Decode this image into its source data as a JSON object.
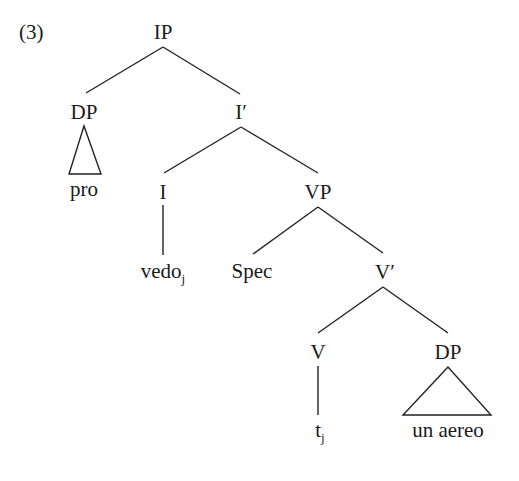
{
  "example_number": "(3)",
  "tree": {
    "root": "IP",
    "nodes": {
      "ip": {
        "label": "IP"
      },
      "dp_subject": {
        "label": "DP",
        "terminal": "pro",
        "triangle": true
      },
      "i_bar": {
        "label": "I",
        "prime": "′"
      },
      "i_head": {
        "label": "I",
        "terminal": "vedo",
        "terminal_subscript": "j"
      },
      "vp": {
        "label": "VP"
      },
      "spec": {
        "label": "Spec"
      },
      "v_bar": {
        "label": "V",
        "prime": "′"
      },
      "v_head": {
        "label": "V",
        "terminal": "t",
        "terminal_subscript": "j"
      },
      "dp_object": {
        "label": "DP",
        "terminal": "un aereo",
        "triangle": true
      }
    },
    "edges": [
      [
        "IP",
        "DP"
      ],
      [
        "IP",
        "I′"
      ],
      [
        "I′",
        "I"
      ],
      [
        "I′",
        "VP"
      ],
      [
        "I",
        "vedoj"
      ],
      [
        "VP",
        "Spec"
      ],
      [
        "VP",
        "V′"
      ],
      [
        "V′",
        "V"
      ],
      [
        "V′",
        "DP"
      ],
      [
        "V",
        "tj"
      ]
    ]
  },
  "colors": {
    "line": "#222222",
    "text": "#1a1a1a",
    "background": "#ffffff"
  }
}
